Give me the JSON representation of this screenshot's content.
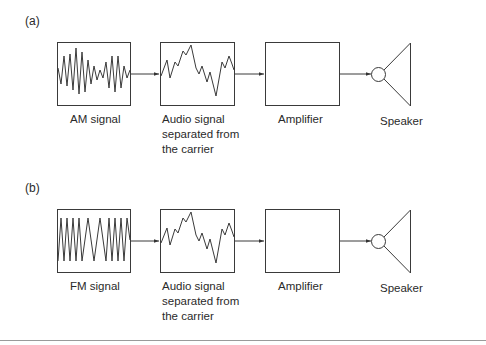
{
  "panels": [
    {
      "label": "(a)",
      "blocks": [
        {
          "name": "am-signal",
          "label": "AM signal",
          "waveform": "amplitude-modulated"
        },
        {
          "name": "audio-signal",
          "label": "Audio signal\nseparated from\nthe carrier",
          "waveform": "audio"
        },
        {
          "name": "amplifier",
          "label": "Amplifier",
          "waveform": "none"
        },
        {
          "name": "speaker",
          "label": "Speaker",
          "icon": "speaker-icon"
        }
      ]
    },
    {
      "label": "(b)",
      "blocks": [
        {
          "name": "fm-signal",
          "label": "FM signal",
          "waveform": "frequency-modulated"
        },
        {
          "name": "audio-signal",
          "label": "Audio signal\nseparated from\nthe carrier",
          "waveform": "audio"
        },
        {
          "name": "amplifier",
          "label": "Amplifier",
          "waveform": "none"
        },
        {
          "name": "speaker",
          "label": "Speaker",
          "icon": "speaker-icon"
        }
      ]
    }
  ],
  "colors": {
    "stroke": "#3a3a3a",
    "background": "#ffffff",
    "rule": "#9a9a9a"
  }
}
